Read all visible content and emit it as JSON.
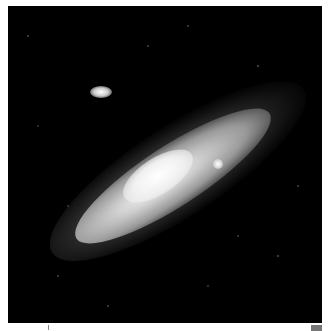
{
  "image": {
    "subject": "spiral galaxy with two companion galaxies against star field",
    "background_color": "#000000",
    "border_color": "#ffffff"
  }
}
